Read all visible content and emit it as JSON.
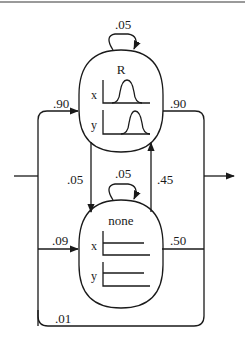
{
  "diagram": {
    "type": "state-transition",
    "nodes": {
      "r": {
        "title": "R",
        "axes": [
          "x",
          "y"
        ],
        "emission": "peaked"
      },
      "none": {
        "title": "none",
        "axes": [
          "x",
          "y"
        ],
        "emission": "flat"
      }
    },
    "edges": {
      "r_self": ".05",
      "none_self": ".05",
      "entry_to_r": ".90",
      "r_exit": ".90",
      "r_to_none": ".05",
      "none_to_r": ".45",
      "entry_to_none": ".09",
      "none_exit": ".50",
      "entry_to_exit": ".01"
    },
    "colors": {
      "line": "#1a1a1a",
      "top_rule": "#9a9a9a",
      "background": "#ffffff"
    }
  }
}
